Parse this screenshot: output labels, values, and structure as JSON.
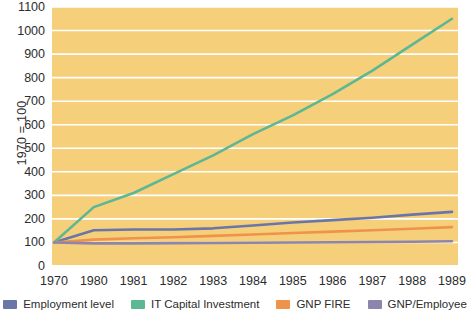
{
  "chart_data": {
    "type": "line",
    "title": "",
    "xlabel": "",
    "ylabel": "1970 = 100",
    "categories": [
      "1970",
      "1980",
      "1981",
      "1982",
      "1983",
      "1984",
      "1985",
      "1986",
      "1987",
      "1988",
      "1989"
    ],
    "ylim": [
      0,
      1100
    ],
    "ytick_step": 100,
    "yticks": [
      "1100",
      "1000",
      "900",
      "800",
      "700",
      "600",
      "500",
      "400",
      "300",
      "200",
      "100",
      "0"
    ],
    "grid": true,
    "grid_color": "#ffffff",
    "plot_background": "#f6cf7b",
    "legend_position": "bottom",
    "series": [
      {
        "name": "Employment level",
        "color": "#6b76a8",
        "values": [
          100,
          152,
          155,
          155,
          160,
          172,
          185,
          195,
          205,
          218,
          230
        ]
      },
      {
        "name": "IT Capital Investment",
        "color": "#5cb795",
        "values": [
          100,
          250,
          310,
          390,
          470,
          560,
          640,
          730,
          830,
          940,
          1050
        ]
      },
      {
        "name": "GNP FIRE",
        "color": "#f0934a",
        "values": [
          100,
          112,
          118,
          122,
          128,
          134,
          140,
          146,
          152,
          158,
          165
        ]
      },
      {
        "name": "GNP/Employee",
        "color": "#8d85ab",
        "values": [
          100,
          96,
          96,
          97,
          98,
          99,
          100,
          101,
          102,
          103,
          105
        ]
      }
    ]
  },
  "colors": {
    "plot_background": "#f6cf7b",
    "grid": "#ffffff",
    "text": "#2c2c2c",
    "employment_level": "#6b76a8",
    "it_capital_investment": "#5cb795",
    "gnp_fire": "#f0934a",
    "gnp_per_employee": "#8d85ab"
  }
}
